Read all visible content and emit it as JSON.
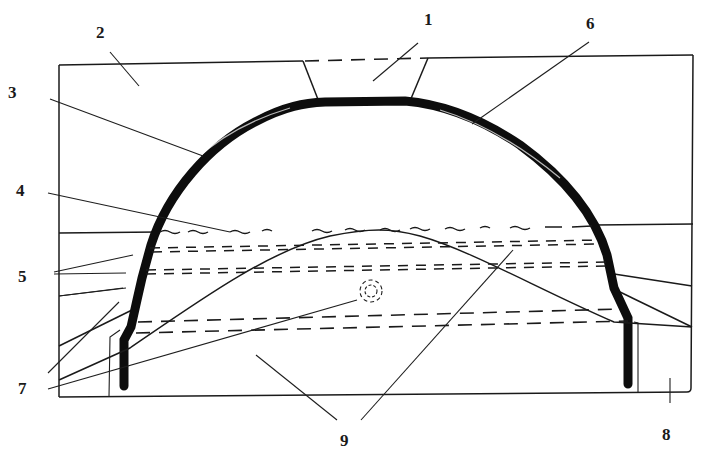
{
  "diagram": {
    "type": "engineering cross-section (arched tunnel / vault in ground)",
    "labels": [
      {
        "id": "1",
        "text": "1",
        "x": 430,
        "y": 25
      },
      {
        "id": "2",
        "text": "2",
        "x": 101,
        "y": 38
      },
      {
        "id": "3",
        "text": "3",
        "x": 15,
        "y": 98
      },
      {
        "id": "4",
        "text": "4",
        "x": 22,
        "y": 196
      },
      {
        "id": "5",
        "text": "5",
        "x": 24,
        "y": 282
      },
      {
        "id": "6",
        "text": "6",
        "x": 592,
        "y": 29
      },
      {
        "id": "7",
        "text": "7",
        "x": 24,
        "y": 394
      },
      {
        "id": "8",
        "text": "8",
        "x": 668,
        "y": 440
      },
      {
        "id": "9",
        "text": "9",
        "x": 345,
        "y": 446
      }
    ],
    "colors": {
      "background": "#ffffff",
      "ink": "#1a1a1a"
    }
  }
}
